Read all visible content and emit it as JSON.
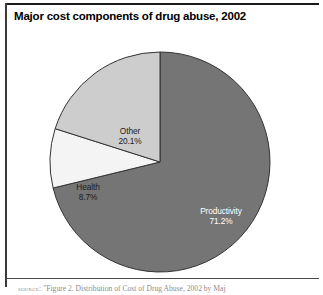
{
  "figure": {
    "title": "Major cost components of drug abuse, 2002",
    "caption_prefix": "source:",
    "caption_text": "\"Figure 2. Distribution of Cost of Drug Abuse, 2002 by Maj"
  },
  "colors": {
    "productivity": "#757575",
    "health": "#f4f4f4",
    "other": "#cdcdcd",
    "slice_outline": "#333333",
    "rule": "#1a1a1a",
    "title_text": "#000000",
    "caption_text": "#8e8e8e",
    "label_dark": "#1c1c1c",
    "label_light": "#ffffff"
  },
  "chart_data": {
    "type": "pie",
    "title": "Major cost components of drug abuse, 2002",
    "subtitle": "",
    "xlabel": "",
    "ylabel": "",
    "legend_position": "none",
    "grid": false,
    "start_angle_deg": 0,
    "direction": "clockwise",
    "units": "percent",
    "categories": [
      "Productivity",
      "Health",
      "Other"
    ],
    "values": [
      71.2,
      8.7,
      20.1
    ],
    "slices": [
      {
        "name": "Productivity",
        "value": 71.2,
        "label": "Productivity",
        "value_label": "71.2%",
        "color": "#757575",
        "label_color": "#ffffff"
      },
      {
        "name": "Health",
        "value": 8.7,
        "label": "Health",
        "value_label": "8.7%",
        "color": "#f4f4f4",
        "label_color": "#1c1c1c"
      },
      {
        "name": "Other",
        "value": 20.1,
        "label": "Other",
        "value_label": "20.1%",
        "color": "#cdcdcd",
        "label_color": "#1c1c1c"
      }
    ]
  }
}
